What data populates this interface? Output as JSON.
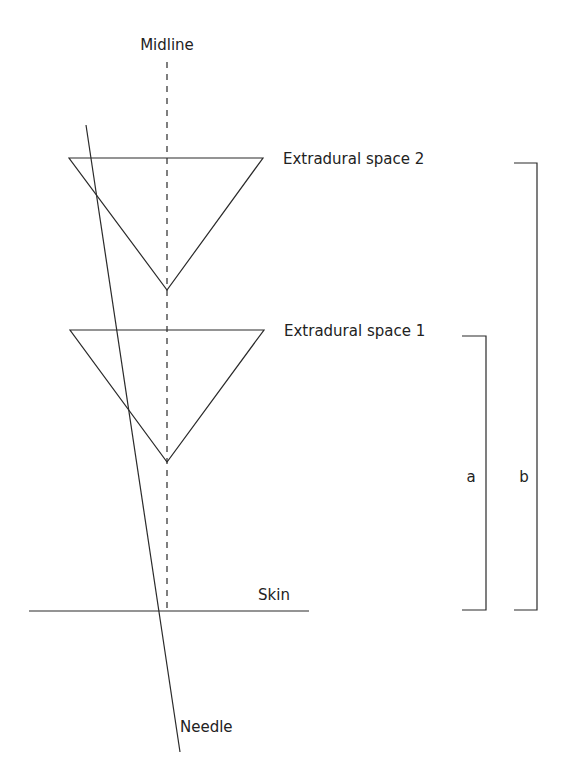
{
  "labels": {
    "midline": "Midline",
    "space2": "Extradural space 2",
    "space1": "Extradural space 1",
    "skin": "Skin",
    "needle": "Needle",
    "a": "a",
    "b": "b"
  },
  "colors": {
    "line": "#2a2a2a",
    "text": "#222222",
    "background": "#ffffff"
  }
}
